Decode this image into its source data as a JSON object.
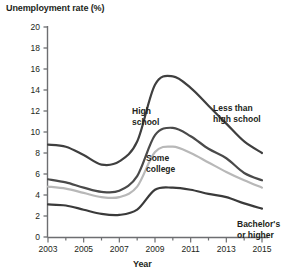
{
  "chart_data": {
    "type": "line",
    "title": "Unemployment rate (%)",
    "xlabel": "Year",
    "ylabel": "Unemployment rate (%)",
    "xlim": [
      2003,
      2015
    ],
    "ylim": [
      0,
      20
    ],
    "grid": false,
    "legend": "inline-labels",
    "xticks": [
      "2003",
      "2005",
      "2007",
      "2009",
      "2011",
      "2013",
      "2015"
    ],
    "yticks": [
      "0",
      "2",
      "4",
      "6",
      "8",
      "10",
      "12",
      "14",
      "16",
      "18",
      "20"
    ],
    "x": [
      2003,
      2004,
      2005,
      2006,
      2007,
      2008,
      2009,
      2010,
      2011,
      2012,
      2013,
      2014,
      2015
    ],
    "series": [
      {
        "name": "Less than high school",
        "color": "#3f3f3f",
        "values": [
          8.8,
          8.6,
          7.8,
          6.9,
          7.2,
          9.1,
          14.5,
          15.3,
          14.2,
          12.5,
          10.8,
          9.1,
          8.0
        ]
      },
      {
        "name": "High school",
        "color": "#4a4a4a",
        "values": [
          5.5,
          5.2,
          4.7,
          4.3,
          4.4,
          5.8,
          9.7,
          10.4,
          9.6,
          8.4,
          7.5,
          6.1,
          5.4
        ]
      },
      {
        "name": "Some college",
        "color": "#b8b8b8",
        "values": [
          4.8,
          4.6,
          4.2,
          3.8,
          3.8,
          4.8,
          8.1,
          8.6,
          8.0,
          7.1,
          6.2,
          5.4,
          4.7
        ]
      },
      {
        "name": "Bachelor's or higher",
        "color": "#3a3a3a",
        "values": [
          3.1,
          3.0,
          2.6,
          2.2,
          2.1,
          2.6,
          4.5,
          4.7,
          4.5,
          4.1,
          3.8,
          3.2,
          2.7
        ]
      }
    ],
    "annotations": [
      {
        "text": "High school",
        "lines": [
          "High",
          "school"
        ]
      },
      {
        "text": "Less than high school",
        "lines": [
          "Less than",
          "high school"
        ]
      },
      {
        "text": "Some college",
        "lines": [
          "Some",
          "college"
        ]
      },
      {
        "text": "Bachelor's or higher",
        "lines": [
          "Bachelor's",
          "or higher"
        ]
      }
    ]
  },
  "axis": {
    "y_label_0": "0",
    "y_label_2": "2",
    "y_label_4": "4",
    "y_label_6": "6",
    "y_label_8": "8",
    "y_label_10": "10",
    "y_label_12": "12",
    "y_label_14": "14",
    "y_label_16": "16",
    "y_label_18": "18",
    "y_label_20": "20",
    "x_label_2003": "2003",
    "x_label_2005": "2005",
    "x_label_2007": "2007",
    "x_label_2009": "2009",
    "x_label_2011": "2011",
    "x_label_2013": "2013",
    "x_label_2015": "2015"
  },
  "labels": {
    "high_school_1": "High",
    "high_school_2": "school",
    "less_than_1": "Less than",
    "less_than_2": "high school",
    "some_college_1": "Some",
    "some_college_2": "college",
    "bachelors_1": "Bachelor's",
    "bachelors_2": "or higher"
  }
}
